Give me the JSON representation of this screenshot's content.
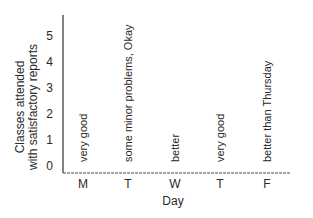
{
  "chart_data": {
    "type": "bar",
    "title": "",
    "xlabel": "Day",
    "ylabel": [
      "Classes attended",
      "with satisfactory reports"
    ],
    "categories": [
      "M",
      "T",
      "W",
      "T",
      "F"
    ],
    "values": [
      0,
      0,
      0,
      0,
      0
    ],
    "annotations": [
      "very good",
      "some minor problems, Okay",
      "better",
      "very good",
      "better than Thursday"
    ],
    "yticks": [
      0,
      1,
      2,
      3,
      4,
      5
    ],
    "ylim": [
      0,
      5.8
    ],
    "grid": false,
    "line_color": "#333333",
    "text_color": "#2a2a2a"
  }
}
